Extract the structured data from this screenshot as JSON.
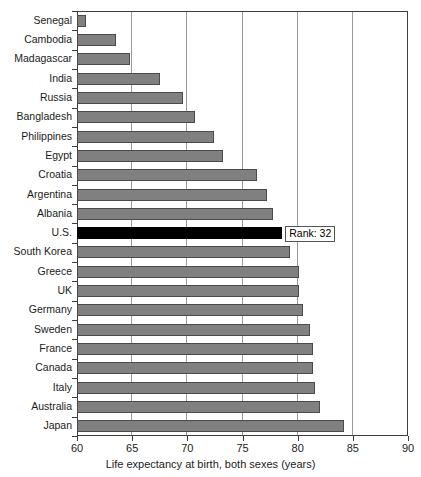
{
  "chart_data": {
    "type": "bar",
    "orientation": "horizontal",
    "title": "",
    "xlabel": "Life expectancy at birth, both sexes (years)",
    "ylabel": "",
    "xlim": [
      60,
      90
    ],
    "xticks": [
      60,
      65,
      70,
      75,
      80,
      85,
      90
    ],
    "xtick_labels": [
      "60",
      "65",
      "70",
      "75",
      "80",
      "85",
      "90"
    ],
    "grid": "vertical gridlines at 65, 70, 75, 80, 85",
    "legend": "none",
    "bar_color": "#808080",
    "highlight_color": "#000000",
    "highlight_category": "U.S.",
    "categories": [
      "Senegal",
      "Cambodia",
      "Madagascar",
      "India",
      "Russia",
      "Bangladesh",
      "Philippines",
      "Egypt",
      "Croatia",
      "Argentina",
      "Albania",
      "U.S.",
      "South Korea",
      "Greece",
      "UK",
      "Germany",
      "Sweden",
      "France",
      "Canada",
      "Italy",
      "Australia",
      "Japan"
    ],
    "values": [
      60.8,
      63.5,
      64.8,
      67.5,
      69.6,
      70.7,
      72.4,
      73.2,
      76.3,
      77.2,
      77.8,
      78.6,
      79.3,
      80.1,
      80.1,
      80.5,
      81.1,
      81.4,
      81.4,
      81.6,
      82.0,
      84.2
    ],
    "annotations": [
      {
        "text": "Rank: 32",
        "attached_to": "U.S."
      }
    ]
  }
}
